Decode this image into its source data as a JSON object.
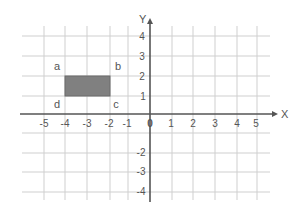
{
  "diagram": {
    "type": "coordinate-plane",
    "axes": {
      "x_label": "X",
      "y_label": "Y",
      "x_ticks": [
        "-5",
        "-4",
        "-3",
        "-2",
        "-1",
        "0",
        "1",
        "2",
        "3",
        "4",
        "5"
      ],
      "y_ticks_positive": [
        "1",
        "2",
        "3",
        "4"
      ],
      "y_ticks_negative": [
        "-2",
        "-3",
        "-4"
      ]
    },
    "rectangle": {
      "fill": "#808080",
      "corners": {
        "a": {
          "label": "a",
          "x": -4,
          "y": 2
        },
        "b": {
          "label": "b",
          "x": -2,
          "y": 2
        },
        "c": {
          "label": "c",
          "x": -2,
          "y": 1
        },
        "d": {
          "label": "d",
          "x": -4,
          "y": 1
        }
      }
    },
    "colors": {
      "grid": "#cfcfcf",
      "axis": "#555555",
      "shape": "#808080"
    }
  }
}
